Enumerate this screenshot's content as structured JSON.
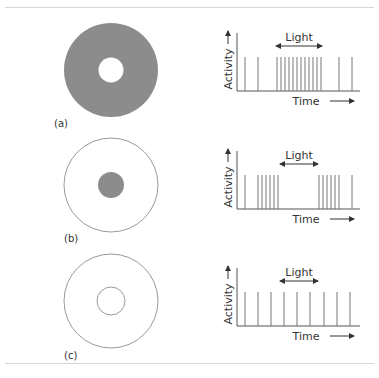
{
  "panels": [
    {
      "label": "(a)",
      "receptive_field": {
        "outer": "filled-gray",
        "inner": "white",
        "description": "Off-center: light on center suppresses, surround excites"
      },
      "light_label": "Light",
      "y_axis_label": "Activity",
      "x_axis_label": "Time"
    },
    {
      "label": "(b)",
      "receptive_field": {
        "outer": "outline",
        "inner": "filled-gray"
      },
      "light_label": "Light",
      "y_axis_label": "Activity",
      "x_axis_label": "Time"
    },
    {
      "label": "(c)",
      "receptive_field": {
        "outer": "outline",
        "inner": "outline"
      },
      "light_label": "Light",
      "y_axis_label": "Activity",
      "x_axis_label": "Time"
    }
  ],
  "chart_data": [
    {
      "type": "spike-train",
      "title": "(a)",
      "xlabel": "Time",
      "ylabel": "Activity",
      "annotation": "Light",
      "light_interval": [
        276,
        322
      ],
      "spikes_x": [
        245,
        258,
        277,
        281,
        285,
        289,
        293,
        297,
        301,
        305,
        309,
        313,
        317,
        321,
        339,
        352
      ]
    },
    {
      "type": "spike-train",
      "title": "(b)",
      "xlabel": "Time",
      "ylabel": "Activity",
      "annotation": "Light",
      "light_interval": [
        280,
        318
      ],
      "spikes_x": [
        245,
        258,
        262,
        266,
        270,
        274,
        278,
        319,
        323,
        327,
        331,
        335,
        339,
        352
      ]
    },
    {
      "type": "spike-train",
      "title": "(c)",
      "xlabel": "Time",
      "ylabel": "Activity",
      "annotation": "Light",
      "light_interval": [
        280,
        318
      ],
      "spikes_x": [
        245,
        258,
        271,
        284,
        297,
        310,
        324,
        337,
        350
      ]
    }
  ]
}
